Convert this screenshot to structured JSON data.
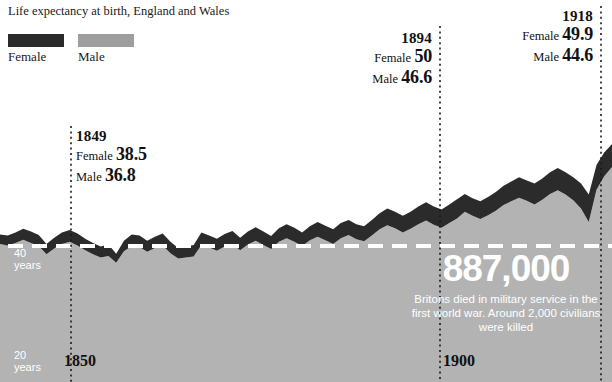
{
  "header": {
    "title": "Life expectancy at birth, England and Wales"
  },
  "legend": {
    "items": [
      {
        "label": "Female",
        "color": "#2b2b2b"
      },
      {
        "label": "Male",
        "color": "#9e9e9e"
      }
    ]
  },
  "annotations": [
    {
      "id": "ann-1849",
      "year": "1849",
      "rows": [
        {
          "key": "Female",
          "value": "38.5"
        },
        {
          "key": "Male",
          "value": "36.8"
        }
      ]
    },
    {
      "id": "ann-1894",
      "year": "1894",
      "rows": [
        {
          "key": "Female",
          "value": "50"
        },
        {
          "key": "Male",
          "value": "46.6"
        }
      ]
    },
    {
      "id": "ann-1918",
      "year": "1918",
      "rows": [
        {
          "key": "Female",
          "value": "49.9"
        },
        {
          "key": "Male",
          "value": "44.6"
        }
      ]
    }
  ],
  "axes": {
    "y_labels": [
      {
        "line1": "40",
        "line2": "years"
      },
      {
        "line1": "20",
        "line2": "years"
      }
    ],
    "x_labels": [
      {
        "label": "1850"
      },
      {
        "label": "1900"
      }
    ]
  },
  "callout": {
    "number": "887,000",
    "body": "Britons died in military service in the first world war. Around 2,000 civilians were killed"
  },
  "chart_data": {
    "type": "area",
    "title": "Life expectancy at birth, England and Wales",
    "xlabel": "",
    "ylabel": "years",
    "xlim": [
      1841,
      1920
    ],
    "ylim": [
      20,
      60
    ],
    "grid": false,
    "legend_position": "top-left",
    "gridline_values": [
      40
    ],
    "tick_years": [
      1850,
      1900
    ],
    "marker_years": [
      1849,
      1894,
      1918
    ],
    "band_fill_below": "#b3b3b3",
    "series": [
      {
        "name": "Female",
        "color": "#2b2b2b",
        "values": [
          42.2,
          42.0,
          42.6,
          43.3,
          42.8,
          42.1,
          40.4,
          41.6,
          42.6,
          43.1,
          42.4,
          41.4,
          40.6,
          39.9,
          40.3,
          38.5,
          41.0,
          42.2,
          42.0,
          41.0,
          41.8,
          42.4,
          40.8,
          39.6,
          39.9,
          40.2,
          42.6,
          42.0,
          41.4,
          42.3,
          42.9,
          41.6,
          42.8,
          43.6,
          42.8,
          41.9,
          43.4,
          44.2,
          43.5,
          42.6,
          43.8,
          44.6,
          43.9,
          43.2,
          44.4,
          45.0,
          44.2,
          43.8,
          45.0,
          46.3,
          47.2,
          46.6,
          45.8,
          46.6,
          47.6,
          48.4,
          47.6,
          47.0,
          48.0,
          49.0,
          50.0,
          49.2,
          48.6,
          49.4,
          50.4,
          51.6,
          52.4,
          53.2,
          52.6,
          52.0,
          53.0,
          54.2,
          55.0,
          54.2,
          53.2,
          52.0,
          49.9,
          55.6,
          58.0,
          59.6
        ]
      },
      {
        "name": "Male",
        "color": "#9e9e9e",
        "values": [
          40.4,
          40.1,
          40.6,
          41.2,
          40.6,
          40.0,
          38.4,
          39.5,
          40.4,
          40.8,
          40.1,
          39.2,
          38.4,
          37.8,
          38.1,
          36.8,
          39.0,
          40.0,
          39.8,
          38.9,
          39.6,
          40.1,
          38.6,
          37.6,
          37.8,
          38.0,
          40.2,
          39.7,
          39.1,
          39.9,
          40.4,
          39.2,
          40.3,
          41.0,
          40.2,
          39.4,
          40.8,
          41.5,
          40.8,
          40.0,
          41.1,
          41.8,
          41.1,
          40.4,
          41.5,
          42.1,
          41.3,
          40.9,
          42.0,
          43.2,
          44.0,
          43.4,
          42.6,
          43.3,
          44.2,
          44.9,
          44.1,
          43.5,
          44.4,
          45.3,
          46.6,
          45.8,
          45.2,
          45.9,
          46.8,
          47.9,
          48.6,
          49.3,
          48.7,
          48.0,
          48.9,
          50.0,
          50.7,
          49.9,
          48.8,
          47.2,
          44.6,
          50.8,
          53.4,
          55.2
        ]
      }
    ]
  }
}
